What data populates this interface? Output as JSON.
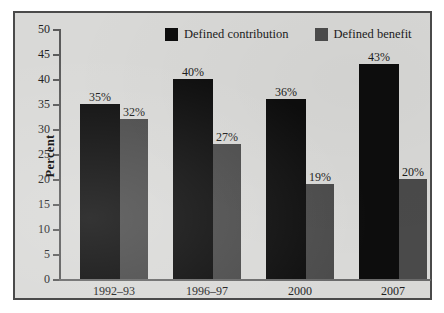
{
  "chart_data": {
    "type": "bar",
    "title": "",
    "subtitle": "",
    "xlabel": "",
    "ylabel": "Percent",
    "categories": [
      "1992–93",
      "1996–97",
      "2000",
      "2007"
    ],
    "series": [
      {
        "name": "Defined contribution",
        "color": "#0d0d0d",
        "values": [
          35,
          40,
          36,
          43
        ],
        "labels": [
          "35%",
          "40%",
          "36%",
          "43%"
        ]
      },
      {
        "name": "Defined benefit",
        "color": "#4a4a4a",
        "values": [
          32,
          27,
          19,
          20
        ],
        "labels": [
          "32%",
          "27%",
          "19%",
          "20%"
        ]
      }
    ],
    "ylim": [
      0,
      50
    ],
    "ytick_values": [
      0,
      5,
      10,
      15,
      20,
      25,
      30,
      35,
      40,
      45,
      50
    ],
    "ytick_labels": [
      "0",
      "5",
      "10",
      "15",
      "20",
      "25",
      "30",
      "35",
      "40",
      "45",
      "50"
    ],
    "grid": false,
    "legend_position": "top-center"
  },
  "legend": {
    "entries": [
      {
        "label": "Defined contribution",
        "color": "#0d0d0d"
      },
      {
        "label": "Defined benefit",
        "color": "#4a4a4a"
      }
    ]
  },
  "panel": {
    "background": "#d9d9d7",
    "border_color": "#4a4a4a"
  }
}
